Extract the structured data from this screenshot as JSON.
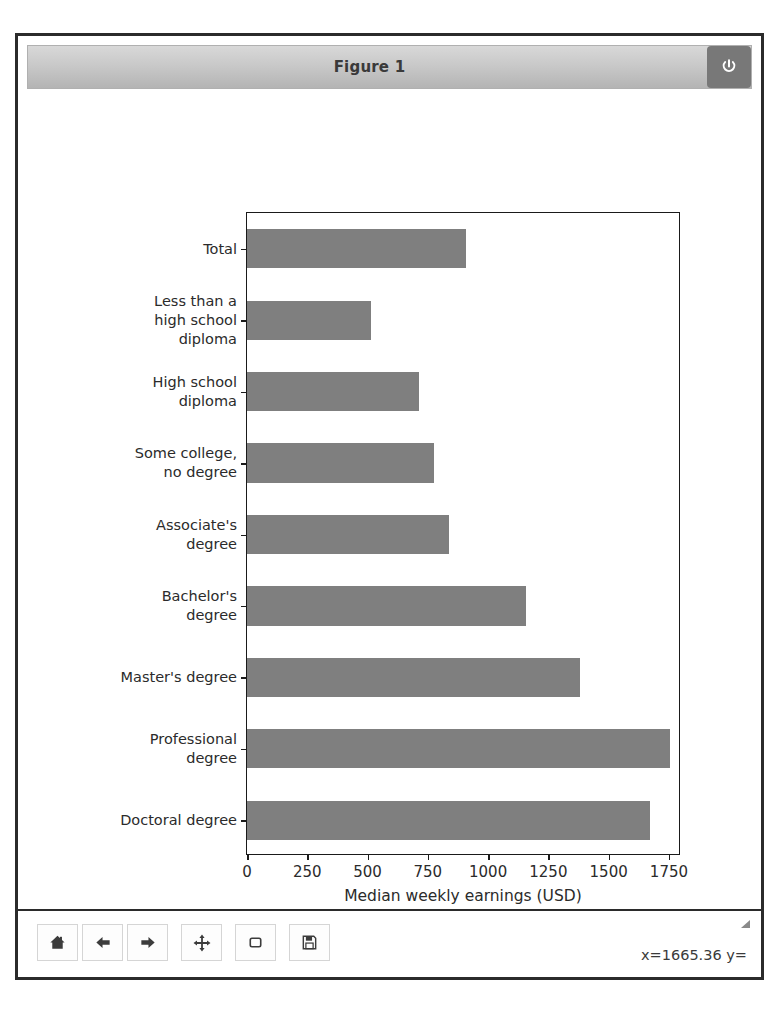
{
  "window": {
    "title": "Figure 1",
    "close_icon": "power-icon"
  },
  "toolbar": {
    "buttons": [
      {
        "name": "home-button",
        "icon": "home-icon",
        "tooltip": "Home"
      },
      {
        "name": "back-button",
        "icon": "arrow-left-icon",
        "tooltip": "Back"
      },
      {
        "name": "forward-button",
        "icon": "arrow-right-icon",
        "tooltip": "Forward"
      },
      {
        "name": "pan-button",
        "icon": "move-icon",
        "tooltip": "Pan"
      },
      {
        "name": "zoom-button",
        "icon": "rectangle-icon",
        "tooltip": "Zoom to rectangle"
      },
      {
        "name": "save-button",
        "icon": "floppy-disk-icon",
        "tooltip": "Save the figure"
      }
    ],
    "coordinates": "x=1665.36 y="
  },
  "chart_data": {
    "type": "bar",
    "orientation": "horizontal",
    "title": "",
    "xlabel": "Median weekly earnings (USD)",
    "ylabel": "",
    "xlim": [
      0,
      1800
    ],
    "xticks": [
      0,
      250,
      500,
      750,
      1000,
      1250,
      1500,
      1750
    ],
    "xticklabels": [
      "0",
      "250",
      "500",
      "750",
      "1000",
      "1250",
      "1500",
      "1750"
    ],
    "grid": false,
    "legend": false,
    "bar_color": "#7f7f7f",
    "categories": [
      "Total",
      "Less than a\nhigh school\ndiploma",
      "High school\ndiploma",
      "Some college,\nno degree",
      "Associate's\ndegree",
      "Bachelor's\ndegree",
      "Master's degree",
      "Professional\ndegree",
      "Doctoral degree"
    ],
    "values": [
      907,
      515,
      712,
      774,
      836,
      1156,
      1380,
      1754,
      1671
    ]
  }
}
